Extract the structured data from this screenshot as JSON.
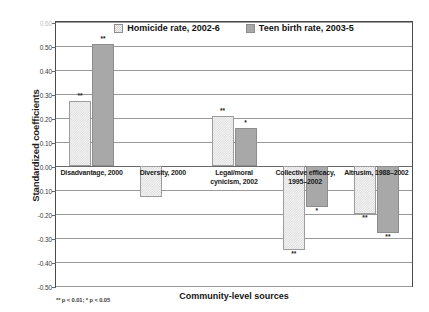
{
  "chart_data": {
    "type": "bar",
    "title": "",
    "xlabel": "Community-level sources",
    "ylabel": "Standardized coefficients",
    "ylim": [
      -0.5,
      0.6
    ],
    "ytick_labels": [
      "0.60",
      "0.50",
      "0.40",
      "0.30",
      "0.20",
      "0.10",
      "0.00",
      "-0.10",
      "-0.20",
      "-0.30",
      "-0.40",
      "-0.50"
    ],
    "ytick_values": [
      0.6,
      0.5,
      0.4,
      0.3,
      0.2,
      0.1,
      0.0,
      -0.1,
      -0.2,
      -0.3,
      -0.4,
      -0.5
    ],
    "grid": true,
    "legend_position": "top-center",
    "categories": [
      "Disadvantage, 2000",
      "Diversity, 2000",
      "Legal/moral\ncynicism, 2002",
      "Collective efficacy,\n1995–2002",
      "Altrusim, 1988–2002"
    ],
    "series": [
      {
        "name": "Homicide rate, 2002-6",
        "style": "light-dotted",
        "color": "#f6f6f6",
        "values": [
          0.27,
          -0.13,
          0.21,
          -0.35,
          -0.2
        ],
        "significance": [
          "**",
          "",
          "**",
          "**",
          "**"
        ]
      },
      {
        "name": "Teen birth rate, 2003-5",
        "style": "solid-gray",
        "color": "#a8a8a8",
        "values": [
          0.51,
          null,
          0.16,
          -0.17,
          -0.28
        ],
        "significance": [
          "**",
          "",
          "*",
          "*",
          "**"
        ]
      }
    ],
    "footnote": "** p < 0.01; * p < 0.05"
  }
}
